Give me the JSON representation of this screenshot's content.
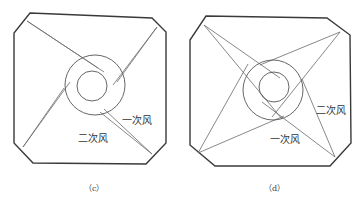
{
  "panels": [
    {
      "id": "c",
      "caption": "（c）",
      "labels": [
        {
          "text": "一次风",
          "x": 122,
          "y": 124
        },
        {
          "text": "二次风",
          "x": 78,
          "y": 142
        }
      ],
      "octagon": "30,13 152,18 166,32 166,143 146,164 33,163 14,143 14,33",
      "outer_circle": {
        "cx": 95,
        "cy": 85,
        "r": 30
      },
      "inner_circle": {
        "cx": 92,
        "cy": 86,
        "r": 15
      },
      "lines": [
        "27,21 98,68",
        "27,21 104,72",
        "157,27 113,85",
        "157,27 117,82",
        "152,154 104,109",
        "152,154 100,112",
        "23,147 70,82",
        "23,147 64,88"
      ]
    },
    {
      "id": "d",
      "caption": "（d）",
      "labels": [
        {
          "text": "二次风",
          "x": 316,
          "y": 114
        },
        {
          "text": "一次风",
          "x": 270,
          "y": 143
        }
      ],
      "octagon": "206,16 327,18 350,35 351,143 330,166 215,166 190,145 190,40",
      "outer_circle": {
        "cx": 273,
        "cy": 90,
        "r": 30
      },
      "inner_circle": {
        "cx": 274,
        "cy": 87,
        "r": 15
      },
      "lines": [
        "204,25 280,78",
        "204,25 282,119",
        "340,32 260,65",
        "340,32 272,117",
        "335,157 262,102",
        "335,157 302,79",
        "198,153 284,116",
        "198,153 248,64"
      ]
    }
  ]
}
